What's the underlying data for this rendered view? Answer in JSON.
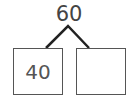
{
  "diagram": {
    "type": "number-bond",
    "whole": "60",
    "parts": [
      "40",
      ""
    ],
    "colors": {
      "stroke": "#222222",
      "text": "#444444",
      "box_border": "#555555"
    }
  }
}
